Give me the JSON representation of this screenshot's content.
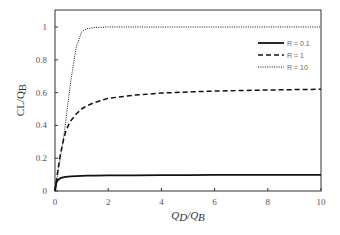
{
  "chart_data": {
    "type": "line",
    "title": "",
    "xlabel": "QD/QB",
    "ylabel": "CL/QB",
    "xlim": [
      0,
      10
    ],
    "ylim": [
      0,
      1.1
    ],
    "xticks": [
      0,
      2,
      4,
      6,
      8,
      10
    ],
    "yticks": [
      0,
      0.2,
      0.4,
      0.6,
      0.8,
      1
    ],
    "grid": false,
    "legend_position": "upper right",
    "x": [
      0,
      0.05,
      0.1,
      0.2,
      0.3,
      0.4,
      0.5,
      0.6,
      0.8,
      1.0,
      1.2,
      1.5,
      2,
      3,
      4,
      5,
      6,
      7,
      8,
      9,
      10
    ],
    "series": [
      {
        "name": "R = 0.1",
        "style": "solid",
        "values": [
          0,
          0.05,
          0.065,
          0.078,
          0.083,
          0.086,
          0.088,
          0.089,
          0.091,
          0.092,
          0.093,
          0.094,
          0.095,
          0.096,
          0.097,
          0.097,
          0.098,
          0.098,
          0.098,
          0.099,
          0.099
        ]
      },
      {
        "name": "R = 1",
        "style": "dashed",
        "values": [
          0,
          0.06,
          0.12,
          0.22,
          0.3,
          0.36,
          0.4,
          0.43,
          0.47,
          0.5,
          0.52,
          0.54,
          0.565,
          0.585,
          0.597,
          0.604,
          0.609,
          0.613,
          0.616,
          0.618,
          0.62
        ]
      },
      {
        "name": "R = 10",
        "style": "dotted",
        "values": [
          0,
          0.05,
          0.1,
          0.2,
          0.3,
          0.42,
          0.55,
          0.68,
          0.88,
          0.97,
          0.99,
          0.997,
          1.0,
          1.0,
          1.0,
          1.0,
          1.0,
          1.0,
          1.0,
          1.0,
          1.0
        ]
      }
    ]
  },
  "axes": {
    "x_label_main": "Q",
    "x_label_sub1": "D",
    "x_label_sep": "/Q",
    "x_label_sub2": "B",
    "y_label_main": "CL/Q",
    "y_label_sub": "B"
  },
  "legend": [
    {
      "label": "R = 0.1",
      "style": "solid"
    },
    {
      "label": "R = 1",
      "style": "dashed"
    },
    {
      "label": "R = 10",
      "style": "dotted"
    }
  ]
}
